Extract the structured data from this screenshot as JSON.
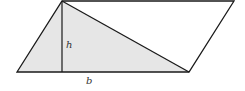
{
  "diagram": {
    "labels": {
      "height": "h",
      "base": "b"
    },
    "colors": {
      "stroke": "#1a1a1a",
      "shaded_fill": "#e6e6e6",
      "background": "#ffffff"
    },
    "vertices": {
      "top_left": [
        62,
        1
      ],
      "top_right": [
        234,
        1
      ],
      "bottom_left": [
        17,
        72
      ],
      "bottom_right": [
        189,
        72
      ]
    }
  }
}
